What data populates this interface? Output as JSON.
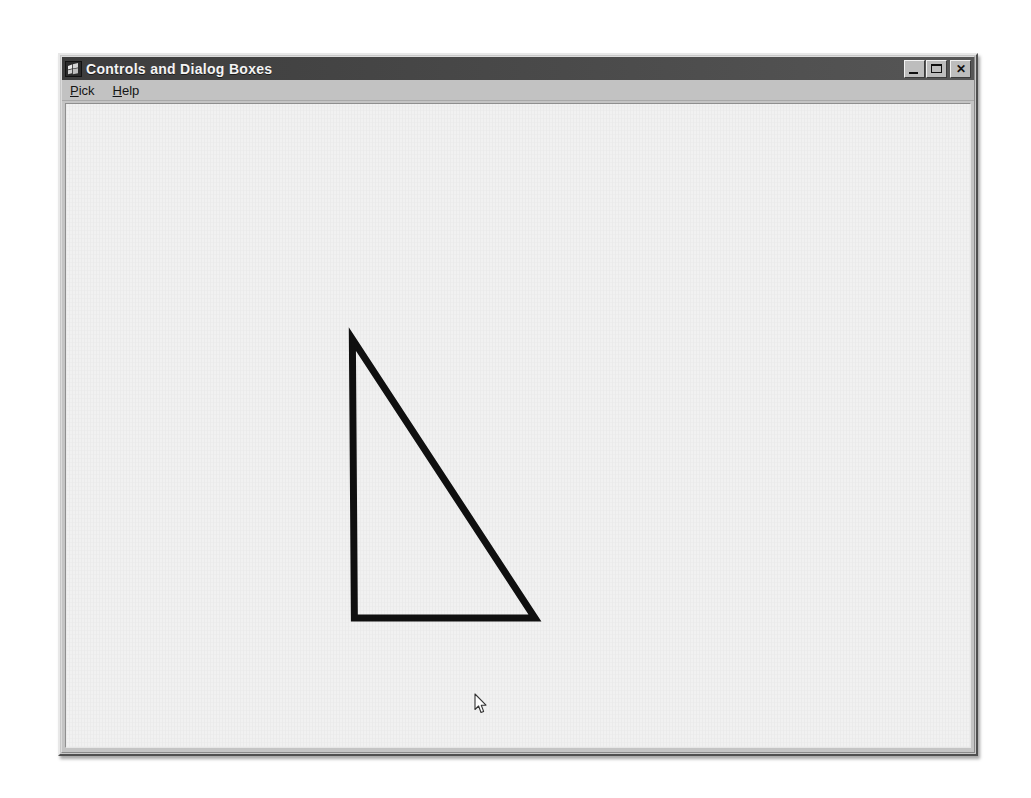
{
  "window": {
    "title": "Controls and Dialog Boxes",
    "icon": "windows-flag-icon",
    "titlebar_color": "#4a4a4a",
    "face_color": "#c4c4c4",
    "client_color": "#f1f1f1",
    "buttons": [
      {
        "name": "minimize",
        "label": "_",
        "tooltip": "Minimize"
      },
      {
        "name": "maximize",
        "label": "□",
        "tooltip": "Maximize"
      },
      {
        "name": "close",
        "label": "✕",
        "tooltip": "Close"
      }
    ]
  },
  "menu": {
    "items": [
      {
        "label": "Pick",
        "accel": "P",
        "before": "",
        "after": "ick"
      },
      {
        "label": "Help",
        "accel": "H",
        "before": "",
        "after": "elp"
      }
    ]
  },
  "canvas": {
    "description": "right triangle outline drawn in black",
    "stroke_color": "#101010",
    "stroke_width": 7,
    "shape": {
      "type": "polygon",
      "name": "right-triangle",
      "points": "287,235 289,514 470,514"
    },
    "cursor": {
      "type": "arrow-pointer",
      "x": 408,
      "y": 589
    }
  }
}
